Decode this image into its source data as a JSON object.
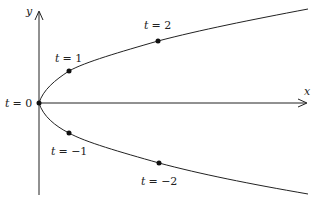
{
  "figure": {
    "type": "parametric-curve",
    "axes": {
      "x_label": "x",
      "y_label": "y"
    },
    "points": [
      {
        "t": 0,
        "label_var": "t",
        "label_eq": "= 0"
      },
      {
        "t": 1,
        "label_var": "t",
        "label_eq": "= 1"
      },
      {
        "t": 2,
        "label_var": "t",
        "label_eq": "= 2"
      },
      {
        "t": -1,
        "label_var": "t",
        "label_eq": "= −1"
      },
      {
        "t": -2,
        "label_var": "t",
        "label_eq": "= −2"
      }
    ],
    "colors": {
      "stroke": "#222222",
      "background": "#ffffff"
    }
  }
}
